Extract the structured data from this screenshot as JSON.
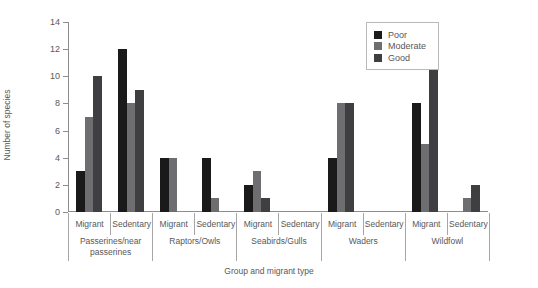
{
  "chart_data": {
    "type": "bar",
    "title": "",
    "xlabel": "Group and migrant type",
    "ylabel": "Number of species",
    "ylim": [
      0,
      14
    ],
    "yticks": [
      0,
      2,
      4,
      6,
      8,
      10,
      12,
      14
    ],
    "grid": false,
    "legend_position": "top-right",
    "categories": [
      "Migrant",
      "Sedentary",
      "Migrant",
      "Sedentary",
      "Migrant",
      "Sedentary",
      "Migrant",
      "Sedentary",
      "Migrant",
      "Sedentary"
    ],
    "groups": [
      "Passerines/near passerines",
      "Raptors/Owls",
      "Seabirds/Gulls",
      "Waders",
      "Wildfowl"
    ],
    "series": [
      {
        "name": "Poor",
        "color": "#1a1a1a",
        "values": [
          3,
          12,
          4,
          4,
          2,
          0,
          4,
          0,
          8,
          0
        ]
      },
      {
        "name": "Moderate",
        "color": "#6e6e70",
        "values": [
          7,
          8,
          4,
          1,
          3,
          0,
          8,
          0,
          5,
          1
        ]
      },
      {
        "name": "Good",
        "color": "#3f3f41",
        "values": [
          10,
          9,
          0,
          0,
          1,
          0,
          8,
          0,
          13,
          2
        ]
      }
    ]
  }
}
